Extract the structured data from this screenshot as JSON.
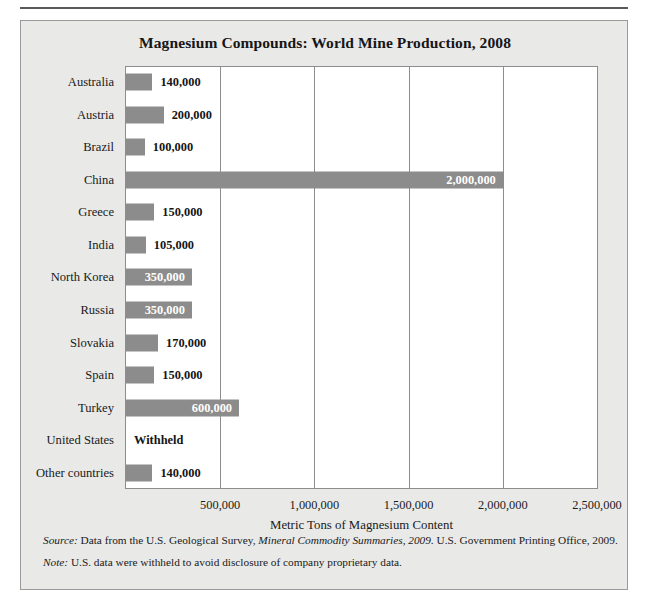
{
  "figure": {
    "title": "Magnesium Compounds: World Mine Production, 2008",
    "bar_color": "#8c8c8c",
    "background_color": "#e9e9e7",
    "plot_background_color": "#ffffff"
  },
  "chart_data": {
    "type": "bar",
    "orientation": "horizontal",
    "title": "Magnesium Compounds: World Mine Production, 2008",
    "xlabel": "Metric Tons of Magnesium Content",
    "ylabel": "",
    "xlim": [
      0,
      2500000
    ],
    "xticks": [
      500000,
      1000000,
      1500000,
      2000000,
      2500000
    ],
    "xtick_labels": [
      "500,000",
      "1,000,000",
      "1,500,000",
      "2,000,000",
      "2,500,000"
    ],
    "grid": true,
    "legend": false,
    "categories": [
      "Australia",
      "Austria",
      "Brazil",
      "China",
      "Greece",
      "India",
      "North Korea",
      "Russia",
      "Slovakia",
      "Spain",
      "Turkey",
      "United States",
      "Other countries"
    ],
    "values": [
      140000,
      200000,
      100000,
      2000000,
      150000,
      105000,
      350000,
      350000,
      170000,
      150000,
      600000,
      null,
      140000
    ],
    "value_labels": [
      "140,000",
      "200,000",
      "100,000",
      "2,000,000",
      "150,000",
      "105,000",
      "350,000",
      "350,000",
      "170,000",
      "150,000",
      "600,000",
      "Withheld",
      "140,000"
    ],
    "label_placement": [
      "outside",
      "outside",
      "outside",
      "inside",
      "outside",
      "outside",
      "inside",
      "inside",
      "outside",
      "outside",
      "inside",
      "outside",
      "outside"
    ]
  },
  "notes": {
    "source_lead": "Source:",
    "source_text_a": " Data from the U.S. Geological Survey, ",
    "source_text_em": "Mineral Commodity Summaries, 2009.",
    "source_text_b": " U.S. Government Printing Office, 2009.",
    "note_lead": "Note:",
    "note_text": " U.S. data were withheld to avoid disclosure of company proprietary data."
  }
}
